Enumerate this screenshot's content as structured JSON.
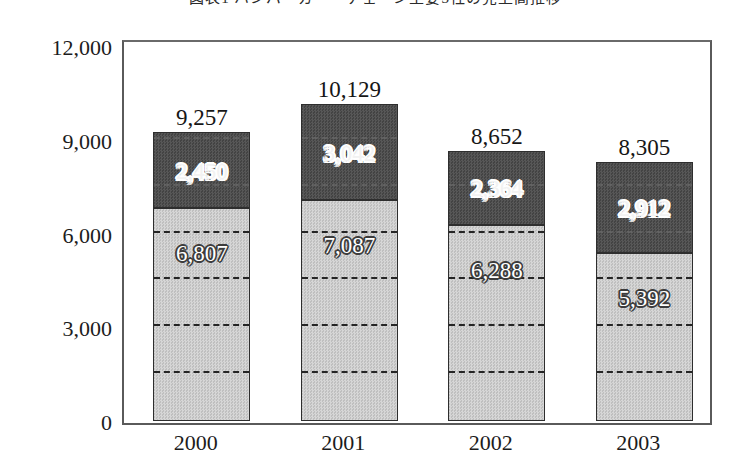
{
  "chart_data": {
    "type": "bar",
    "stacked": true,
    "title": "図表1 ハンバーガー・チェーン主要3社の売上高推移",
    "xlabel": "",
    "ylabel": "",
    "categories": [
      "2000",
      "2001",
      "2002",
      "2003"
    ],
    "series": [
      {
        "name": "下段",
        "color": "#c9c9c9",
        "values": [
          6807,
          7087,
          6288,
          5392
        ],
        "labels": [
          "6,807",
          "7,087",
          "6,288",
          "5,392"
        ]
      },
      {
        "name": "上段",
        "color": "#4d4d4d",
        "values": [
          2450,
          3042,
          2364,
          2912
        ],
        "labels": [
          "2,450",
          "3,042",
          "2,364",
          "2,912"
        ]
      }
    ],
    "totals": [
      9257,
      10129,
      8652,
      8305
    ],
    "total_labels": [
      "9,257",
      "10,129",
      "8,652",
      "8,305"
    ],
    "ylim": [
      0,
      12000
    ],
    "yticks": [
      0,
      3000,
      6000,
      9000,
      12000
    ],
    "ytick_labels": [
      "0",
      "3,000",
      "6,000",
      "9,000",
      "12,000"
    ],
    "gridlines": {
      "values": [
        1500,
        3000,
        4500,
        6000,
        7500,
        9000,
        10500
      ],
      "style": "dashed",
      "clipped_to_bars": true
    },
    "legend": null,
    "grid": true
  }
}
